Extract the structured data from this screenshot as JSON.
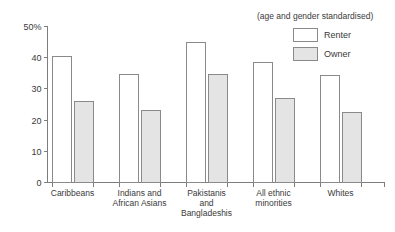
{
  "chart_data": {
    "type": "bar",
    "title": "",
    "subtitle": "",
    "annotation": "(age and gender standardised)",
    "xlabel": "",
    "ylabel": "",
    "ylim": [
      0,
      50
    ],
    "grid": false,
    "legend_position": "top-right",
    "categories": [
      "Caribbeans",
      "Indians and African Asians",
      "Pakistanis and Bangladeshis",
      "All ethnic minorities",
      "Whites"
    ],
    "category_lines": [
      [
        "Caribbeans"
      ],
      [
        "Indians and",
        "African Asians"
      ],
      [
        "Pakistanis",
        "and",
        "Bangladeshis"
      ],
      [
        "All ethnic",
        "minorities"
      ],
      [
        "Whites"
      ]
    ],
    "ytick_labels": [
      "0",
      "10",
      "20",
      "30",
      "40",
      "50%"
    ],
    "ytick_values": [
      0,
      10,
      20,
      30,
      40,
      50
    ],
    "series": [
      {
        "name": "Renter",
        "color": "#ffffff",
        "values": [
          40.4,
          34.6,
          45.0,
          38.5,
          34.3
        ]
      },
      {
        "name": "Owner",
        "color": "#e4e4e4",
        "values": [
          25.9,
          23.1,
          34.5,
          27.0,
          22.4
        ]
      }
    ]
  },
  "legend": {
    "items": [
      {
        "label": "Renter",
        "swatch": "white-square"
      },
      {
        "label": "Owner",
        "swatch": "grey-square"
      }
    ]
  },
  "colors": {
    "axis": "#7d7d7d",
    "bar_outline": "#8a8a8a",
    "renter_fill": "#ffffff",
    "owner_fill": "#e4e4e4",
    "text": "#3a3a3a",
    "background": "#ffffff"
  }
}
